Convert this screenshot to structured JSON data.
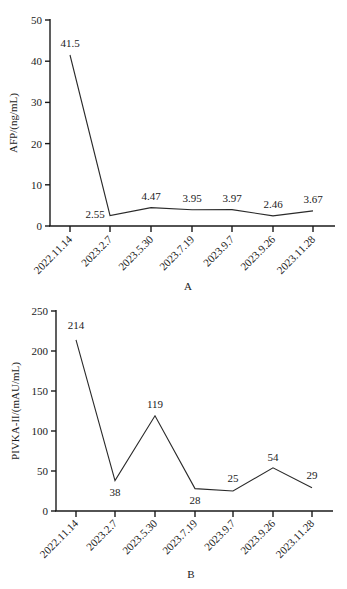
{
  "chart_data": [
    {
      "type": "line",
      "panel": "A",
      "title": "",
      "xlabel": "A",
      "ylabel": "AFP/(ng/mL)",
      "categories": [
        "2022.11.14",
        "2023.2.7",
        "2023.5.30",
        "2023.7.19",
        "2023.9.7",
        "2023.9.26",
        "2023.11.28"
      ],
      "values": [
        41.5,
        2.55,
        4.47,
        3.95,
        3.97,
        2.46,
        3.67
      ],
      "data_labels": [
        "41.5",
        "2.55",
        "4.47",
        "3.95",
        "3.97",
        "2.46",
        "3.67"
      ],
      "yticks": [
        "0",
        "10",
        "20",
        "30",
        "40",
        "50"
      ],
      "ylim": [
        0,
        50
      ],
      "grid": false,
      "legend": null
    },
    {
      "type": "line",
      "panel": "B",
      "title": "",
      "xlabel": "B",
      "ylabel": "PIVKA-II/(mAU/mL)",
      "categories": [
        "2022.11.14",
        "2023.2.7",
        "2023.5.30",
        "2023.7.19",
        "2023.9.7",
        "2023.9.26",
        "2023.11.28"
      ],
      "values": [
        214,
        38,
        119,
        28,
        25,
        54,
        29
      ],
      "data_labels": [
        "214",
        "38",
        "119",
        "28",
        "25",
        "54",
        "29"
      ],
      "yticks": [
        "0",
        "50",
        "100",
        "150",
        "200",
        "250"
      ],
      "ylim": [
        0,
        250
      ],
      "grid": false,
      "legend": null
    }
  ]
}
